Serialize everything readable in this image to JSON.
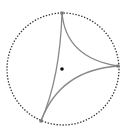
{
  "diagram": {
    "type": "ideal-hyperbolic-triangle-in-disk",
    "circle": {
      "cx": 63,
      "cy": 69,
      "r": 56,
      "stroke": "#333333",
      "style": "dotted"
    },
    "vertices": [
      {
        "name": "top",
        "x": 62,
        "y": 13
      },
      {
        "name": "right",
        "x": 118,
        "y": 66
      },
      {
        "name": "bottom-left",
        "x": 41,
        "y": 121
      }
    ],
    "edges": [
      {
        "name": "top-right",
        "d": "M62,13 Q66,58 118,66"
      },
      {
        "name": "right-bottom",
        "d": "M118,66 Q60,70 41,121"
      },
      {
        "name": "bottom-top",
        "d": "M41,121 Q60,78 62,13"
      }
    ],
    "edge_color": "#888888",
    "center_point": {
      "x": 62,
      "y": 69,
      "r": 1.8,
      "fill": "#111111"
    }
  }
}
